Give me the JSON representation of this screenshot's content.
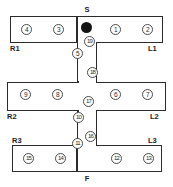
{
  "figure": {
    "colors": {
      "wall": "#2b2b2b",
      "node_outline": "#4a4a4a",
      "marker_fill": "#141414",
      "background": "#ffffff",
      "text": "#1c1c1c"
    }
  },
  "endpoints": {
    "start": "S",
    "finish": "F"
  },
  "arm_labels": {
    "right_1": "R1",
    "left_1": "L1",
    "right_2": "R2",
    "left_2": "L2",
    "right_3": "R3",
    "left_3": "L3"
  },
  "nodes": [
    {
      "id": "n1",
      "label": "1",
      "arm": "L1"
    },
    {
      "id": "n2",
      "label": "2",
      "arm": "L1"
    },
    {
      "id": "n3",
      "label": "3",
      "arm": "R1"
    },
    {
      "id": "n4",
      "label": "4",
      "arm": "R1"
    },
    {
      "id": "n5",
      "label": "5",
      "arm": "corridor-1"
    },
    {
      "id": "n6",
      "label": "6",
      "arm": "L2"
    },
    {
      "id": "n7",
      "label": "7",
      "arm": "L2"
    },
    {
      "id": "n8",
      "label": "8",
      "arm": "R2"
    },
    {
      "id": "n9",
      "label": "9",
      "arm": "R2"
    },
    {
      "id": "n10",
      "label": "10",
      "arm": "corridor-2"
    },
    {
      "id": "n11",
      "label": "11",
      "arm": "corridor-2"
    },
    {
      "id": "n12",
      "label": "12",
      "arm": "L3"
    },
    {
      "id": "n13",
      "label": "13",
      "arm": "L3"
    },
    {
      "id": "n14",
      "label": "14",
      "arm": "R3"
    },
    {
      "id": "n15",
      "label": "15",
      "arm": "R3"
    },
    {
      "id": "n16",
      "label": "16",
      "arm": "corridor-2"
    },
    {
      "id": "n17",
      "label": "17",
      "arm": "corridor-2"
    },
    {
      "id": "n18",
      "label": "18",
      "arm": "corridor-1"
    },
    {
      "id": "n19",
      "label": "19",
      "arm": "corridor-1"
    }
  ],
  "marker": {
    "name": "start-position-marker",
    "description": "filled black circle at start"
  }
}
